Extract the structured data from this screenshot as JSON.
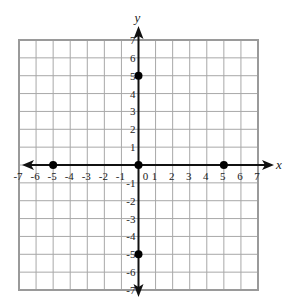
{
  "chart_data": {
    "type": "scatter",
    "title": "",
    "xlabel": "x",
    "ylabel": "y",
    "xlim": [
      -7,
      7
    ],
    "ylim": [
      -7,
      7
    ],
    "grid": true,
    "x_ticks": [
      -7,
      -6,
      -5,
      -4,
      -3,
      -2,
      -1,
      0,
      1,
      2,
      3,
      4,
      5,
      6,
      7
    ],
    "y_ticks": [
      -7,
      -6,
      -5,
      -4,
      -3,
      -2,
      -1,
      1,
      2,
      3,
      4,
      5,
      6,
      7
    ],
    "x_tick_labels": [
      "-7",
      "-6",
      "-5",
      "-4",
      "-3",
      "-2",
      "-1",
      "0",
      "1",
      "2",
      "3",
      "4",
      "5",
      "6",
      "7"
    ],
    "y_tick_labels": [
      "-7",
      "-6",
      "-5",
      "-4",
      "-3",
      "-2",
      "-1",
      "1",
      "2",
      "3",
      "4",
      "5",
      "6",
      "7"
    ],
    "series": [
      {
        "name": "points",
        "points": [
          {
            "x": -5,
            "y": 0
          },
          {
            "x": 0,
            "y": 0
          },
          {
            "x": 5,
            "y": 0
          },
          {
            "x": 0,
            "y": 5
          },
          {
            "x": 0,
            "y": -5
          }
        ]
      }
    ],
    "legend": null
  },
  "colors": {
    "grid": "#a8a8a8",
    "border": "#9a9a9a",
    "axis": "#111111",
    "point": "#000000",
    "text": "#222222"
  },
  "layout": {
    "left": 19,
    "right": 258,
    "top": 40,
    "bottom": 290,
    "origin_x": 139,
    "origin_y": 164
  }
}
